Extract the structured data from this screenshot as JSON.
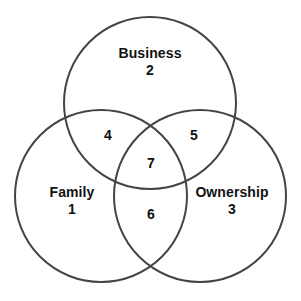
{
  "diagram": {
    "type": "venn",
    "background_color": "#ffffff",
    "stroke_color": "#444444",
    "text_color": "#111111",
    "sets": [
      {
        "id": "business",
        "name": "Business",
        "number": "2",
        "center_x": 150,
        "center_y": 103,
        "radius": 86,
        "label_x": 150,
        "label_y": 62
      },
      {
        "id": "family",
        "name": "Family",
        "number": "1",
        "center_x": 101,
        "center_y": 196,
        "radius": 86,
        "label_x": 72,
        "label_y": 201
      },
      {
        "id": "ownership",
        "name": "Ownership",
        "number": "3",
        "center_x": 200,
        "center_y": 196,
        "radius": 86,
        "label_x": 232,
        "label_y": 201
      }
    ],
    "regions": [
      {
        "id": "family-business",
        "number": "4",
        "label_x": 108,
        "label_y": 135
      },
      {
        "id": "business-ownership",
        "number": "5",
        "label_x": 194,
        "label_y": 135
      },
      {
        "id": "family-business-ownership",
        "number": "7",
        "label_x": 151,
        "label_y": 163
      },
      {
        "id": "family-ownership",
        "number": "6",
        "label_x": 151,
        "label_y": 214
      }
    ]
  }
}
